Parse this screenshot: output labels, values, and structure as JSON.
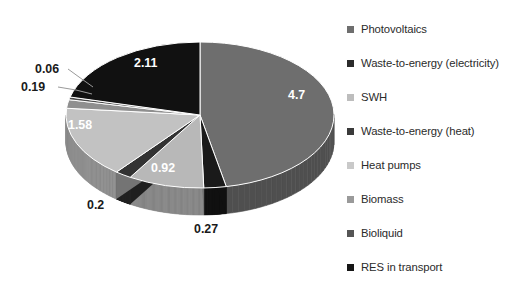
{
  "chart_data": {
    "type": "pie",
    "title": "",
    "subtitle": "",
    "xlabel": "",
    "ylabel": "",
    "grid": false,
    "legend_position": "right",
    "three_d": true,
    "total": 9.93,
    "categories": [
      "Photovoltaics",
      "Waste-to-energy (electricity)",
      "SWH",
      "Waste-to-energy (heat)",
      "Heat pumps",
      "Biomass",
      "Bioliquid",
      "RES in transport"
    ],
    "values": [
      4.7,
      0.27,
      0.92,
      0.2,
      1.58,
      0.19,
      0.06,
      2.11
    ],
    "value_labels": [
      "4.7",
      "0.27",
      "0.92",
      "0.2",
      "1.58",
      "0.19",
      "0.06",
      "2.11"
    ],
    "colors": [
      "#6e6e6e",
      "#1a1a1a",
      "#b8b8b8",
      "#333333",
      "#c2c2c2",
      "#8f8f8f",
      "#4a4a4a",
      "#111111"
    ],
    "slices": [
      {
        "label": "Photovoltaics",
        "value": 4.7,
        "value_label": "4.7",
        "color": "#6e6e6e",
        "label_placement": "inside"
      },
      {
        "label": "Waste-to-energy (electricity)",
        "value": 0.27,
        "value_label": "0.27",
        "color": "#1a1a1a",
        "label_placement": "outside"
      },
      {
        "label": "SWH",
        "value": 0.92,
        "value_label": "0.92",
        "color": "#b8b8b8",
        "label_placement": "inside"
      },
      {
        "label": "Waste-to-energy (heat)",
        "value": 0.2,
        "value_label": "0.2",
        "color": "#333333",
        "label_placement": "outside"
      },
      {
        "label": "Heat pumps",
        "value": 1.58,
        "value_label": "1.58",
        "color": "#c2c2c2",
        "label_placement": "inside"
      },
      {
        "label": "Biomass",
        "value": 0.19,
        "value_label": "0.19",
        "color": "#8f8f8f",
        "label_placement": "outside"
      },
      {
        "label": "Bioliquid",
        "value": 0.06,
        "value_label": "0.06",
        "color": "#4a4a4a",
        "label_placement": "outside"
      },
      {
        "label": "RES in transport",
        "value": 2.11,
        "value_label": "2.11",
        "color": "#111111",
        "label_placement": "inside"
      }
    ]
  },
  "legend": {
    "items": [
      {
        "label": "Photovoltaics",
        "color": "#6e6e6e"
      },
      {
        "label": "Waste-to-energy (electricity)",
        "color": "#2b2b2b"
      },
      {
        "label": "SWH",
        "color": "#bdbdbd"
      },
      {
        "label": "Waste-to-energy (heat)",
        "color": "#3a3a3a"
      },
      {
        "label": "Heat pumps",
        "color": "#c9c9c9"
      },
      {
        "label": "Biomass",
        "color": "#9a9a9a"
      },
      {
        "label": "Bioliquid",
        "color": "#555555"
      },
      {
        "label": "RES in transport",
        "color": "#161616"
      }
    ]
  },
  "data_labels": [
    {
      "text": "2.11",
      "left": 134,
      "top": 56,
      "placement": "inside"
    },
    {
      "text": "4.7",
      "left": 288,
      "top": 88,
      "placement": "inside"
    },
    {
      "text": "1.58",
      "left": 68,
      "top": 118,
      "placement": "inside"
    },
    {
      "text": "0.92",
      "left": 151,
      "top": 161,
      "placement": "inside"
    },
    {
      "text": "0.06",
      "left": 35,
      "top": 62,
      "placement": "outside"
    },
    {
      "text": "0.19",
      "left": 21,
      "top": 80,
      "placement": "outside"
    },
    {
      "text": "0.2",
      "left": 87,
      "top": 198,
      "placement": "outside"
    },
    {
      "text": "0.27",
      "left": 194,
      "top": 222,
      "placement": "outside"
    }
  ]
}
